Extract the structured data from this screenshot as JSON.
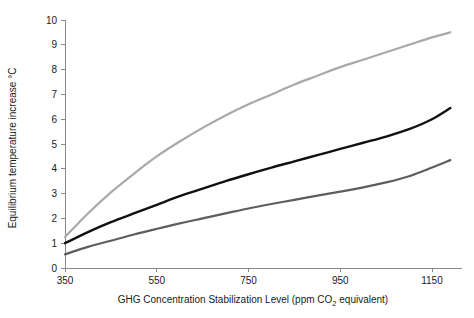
{
  "chart_data": {
    "type": "line",
    "title": "",
    "xlabel": "GHG Concentration Stabilization Level (ppm CO2 equivalent)",
    "xlabel_prefix": "GHG Concentration Stabilization Level (ppm CO",
    "xlabel_subscript": "2",
    "xlabel_suffix": " equivalent)",
    "ylabel": "Equilibrium temperature increase °C",
    "xlim": [
      350,
      1190
    ],
    "ylim": [
      0,
      10
    ],
    "xticks": [
      350,
      550,
      750,
      950,
      1150
    ],
    "yticks": [
      0,
      1,
      2,
      3,
      4,
      5,
      6,
      7,
      8,
      9,
      10
    ],
    "xtick_labels": [
      "350",
      "550",
      "750",
      "950",
      "1150"
    ],
    "ytick_labels": [
      "0",
      "1",
      "2",
      "3",
      "4",
      "5",
      "6",
      "7",
      "8",
      "9",
      "10"
    ],
    "grid": false,
    "legend": "none",
    "x": [
      350,
      400,
      450,
      500,
      550,
      600,
      650,
      700,
      750,
      800,
      850,
      900,
      950,
      1000,
      1050,
      1100,
      1150,
      1190
    ],
    "series": [
      {
        "name": "upper-bound",
        "color": "#a9a9a9",
        "width": 2.2,
        "values": [
          1.25,
          2.2,
          3.05,
          3.8,
          4.5,
          5.1,
          5.65,
          6.15,
          6.6,
          7.0,
          7.4,
          7.75,
          8.1,
          8.4,
          8.7,
          9.0,
          9.3,
          9.5
        ]
      },
      {
        "name": "best-estimate",
        "color": "#111111",
        "width": 2.4,
        "values": [
          1.0,
          1.45,
          1.85,
          2.2,
          2.55,
          2.9,
          3.2,
          3.5,
          3.78,
          4.05,
          4.3,
          4.55,
          4.8,
          5.05,
          5.3,
          5.6,
          6.0,
          6.45
        ]
      },
      {
        "name": "lower-bound",
        "color": "#5e5e5e",
        "width": 2.2,
        "values": [
          0.55,
          0.85,
          1.1,
          1.35,
          1.58,
          1.8,
          2.0,
          2.2,
          2.4,
          2.58,
          2.75,
          2.92,
          3.08,
          3.25,
          3.45,
          3.7,
          4.05,
          4.35
        ]
      }
    ]
  }
}
